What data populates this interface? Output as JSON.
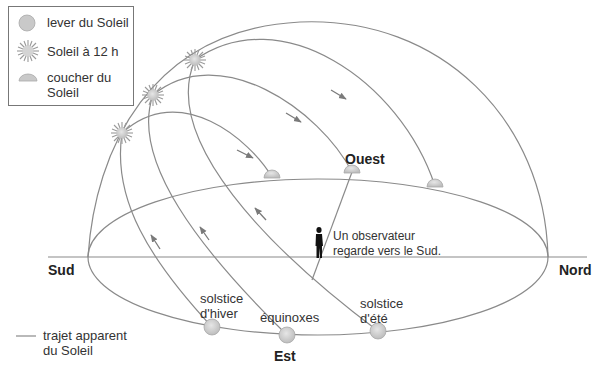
{
  "legend": {
    "items": [
      {
        "icon": "sunrise-icon",
        "label": "lever du Soleil"
      },
      {
        "icon": "noon-sun-icon",
        "label": "Soleil à 12 h"
      },
      {
        "icon": "sunset-icon",
        "label": "coucher du Soleil",
        "line1": "coucher du",
        "line2": "Soleil"
      }
    ],
    "path_legend": {
      "line1": "trajet apparent",
      "line2": "du Soleil"
    }
  },
  "directions": {
    "south": "Sud",
    "north": "Nord",
    "east": "Est",
    "west": "Ouest"
  },
  "observer": {
    "line1": "Un observateur",
    "line2": "regarde vers le Sud."
  },
  "paths": [
    {
      "name": "solstice d'hiver",
      "line1": "solstice",
      "line2": "d'hiver"
    },
    {
      "name": "équinoxes",
      "line1": "équinoxes"
    },
    {
      "name": "solstice d'été",
      "line1": "solstice",
      "line2": "d'été"
    }
  ],
  "colors": {
    "line": "#8a8a8a",
    "sun_fill": "#cfcfcf",
    "sun_stroke": "#a8a8a8",
    "arrow": "#7a7a7a",
    "text": "#333333"
  }
}
